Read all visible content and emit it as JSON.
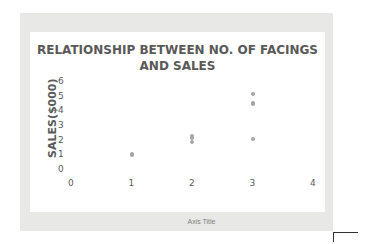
{
  "chart_data": {
    "type": "scatter",
    "title": "RELATIONSHIP BETWEEN NO. OF FACINGS AND SALES",
    "xlabel": "Axis Title",
    "ylabel": "SALES($000)",
    "xlim": [
      0,
      4
    ],
    "ylim": [
      0,
      6
    ],
    "x_ticks": [
      "0",
      "1",
      "2",
      "3",
      "4"
    ],
    "y_ticks": [
      "0",
      "1",
      "2",
      "3",
      "4",
      "5",
      "6"
    ],
    "grid": false,
    "legend": "none",
    "series": [
      {
        "name": "Sales",
        "color": "#a5a5a5",
        "points": [
          {
            "x": 1,
            "y": 1.0
          },
          {
            "x": 1,
            "y": 1.1
          },
          {
            "x": 2,
            "y": 1.9
          },
          {
            "x": 2,
            "y": 2.2
          },
          {
            "x": 2,
            "y": 2.3
          },
          {
            "x": 3,
            "y": 2.1
          },
          {
            "x": 3,
            "y": 4.5
          },
          {
            "x": 3,
            "y": 4.6
          },
          {
            "x": 3,
            "y": 5.2
          }
        ]
      }
    ]
  },
  "title_line1": "RELATIONSHIP BETWEEN NO. OF FACINGS",
  "title_line2": "AND SALES"
}
